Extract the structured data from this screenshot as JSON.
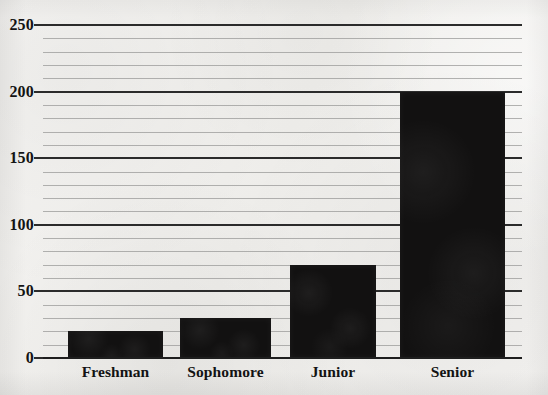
{
  "chart_data": {
    "type": "bar",
    "title": "",
    "subtitle": "",
    "xlabel": "",
    "ylabel": "",
    "categories": [
      "Freshman",
      "Sophomore",
      "Junior",
      "Senior"
    ],
    "values": [
      20,
      30,
      70,
      200
    ],
    "series": [
      {
        "name": "Count",
        "values": [
          20,
          30,
          70,
          200
        ]
      }
    ],
    "ylim": [
      0,
      250
    ],
    "y_major_ticks": [
      0,
      50,
      100,
      150,
      200,
      250
    ],
    "y_major_tick_labels": [
      "0",
      "50",
      "100",
      "150",
      "200",
      "250"
    ],
    "y_minor_tick_interval": 10,
    "grid": "horizontal",
    "legend": "none",
    "annotations": [],
    "bar_color": "#121111",
    "background_color": "#f3f2f0",
    "major_gridline_color": "#2b2b2b",
    "minor_gridline_color": "#9a9a98"
  },
  "axes": {
    "y_labels": [
      "250",
      "200",
      "150",
      "100",
      "50",
      "0"
    ],
    "x_labels": [
      "Freshman",
      "Sophomore",
      "Junior",
      "Senior"
    ]
  }
}
